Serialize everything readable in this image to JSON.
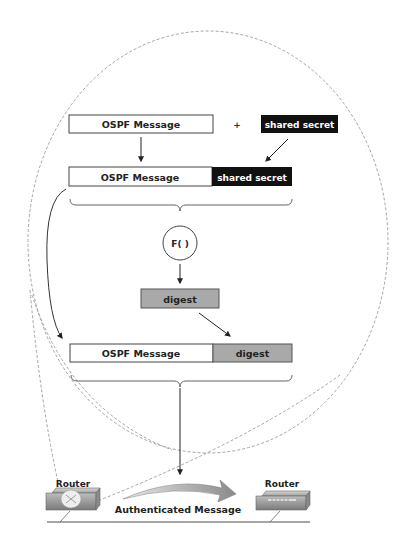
{
  "diagram": {
    "colors": {
      "box_stroke": "#444444",
      "secret_fill": "#111111",
      "secret_text": "#ffffff",
      "digest_fill": "#a9a9a9",
      "dashed": "#9a9a9a",
      "arrow": "#333333"
    },
    "step1": {
      "message_label": "OSPF Message",
      "plus_label": "+",
      "secret_label": "shared secret"
    },
    "step2": {
      "message_label": "OSPF Message",
      "secret_label": "shared secret"
    },
    "function": {
      "label": "F( )"
    },
    "digest": {
      "label": "digest"
    },
    "step3": {
      "message_label": "OSPF Message",
      "digest_label": "digest"
    },
    "network": {
      "left_router_label": "Router",
      "right_router_label": "Router",
      "transfer_label": "Authenticated Message"
    }
  }
}
